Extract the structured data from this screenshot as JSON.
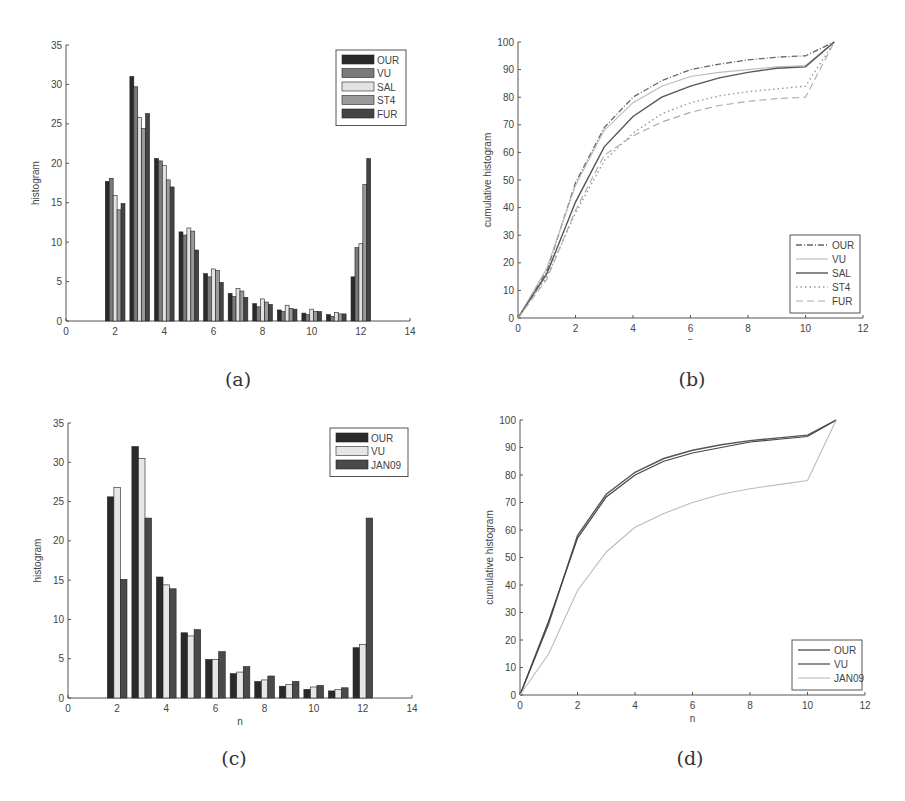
{
  "figure": {
    "captions": [
      "(a)",
      "(b)",
      "(c)",
      "(d)"
    ]
  },
  "colors": {
    "OUR": "#2a2a2a",
    "VU": "#7a7a7a",
    "SAL": "#e2e2e2",
    "ST4": "#9a9a9a",
    "FUR": "#444444",
    "JAN09": "#4a4a4a",
    "VU_c": "#e6e6e6",
    "axis": "#555555"
  },
  "chart_data": [
    {
      "id": "a",
      "type": "bar",
      "title": "",
      "xlabel": "n",
      "ylabel": "histogram",
      "xlim": [
        0,
        14
      ],
      "ylim": [
        0,
        35
      ],
      "xticks": [
        0,
        2,
        4,
        6,
        8,
        10,
        12,
        14
      ],
      "yticks": [
        0,
        5,
        10,
        15,
        20,
        25,
        30,
        35
      ],
      "legend_position": "upper right",
      "grid": false,
      "categories": [
        2,
        3,
        4,
        5,
        6,
        7,
        8,
        9,
        10,
        11,
        12
      ],
      "series": [
        {
          "name": "OUR",
          "values": [
            17.7,
            31.0,
            20.6,
            11.3,
            6.0,
            3.5,
            2.2,
            1.4,
            1.0,
            0.8,
            5.6
          ]
        },
        {
          "name": "VU",
          "values": [
            18.1,
            29.7,
            20.3,
            10.9,
            5.6,
            3.1,
            1.8,
            1.2,
            0.8,
            0.6,
            9.3
          ]
        },
        {
          "name": "SAL",
          "values": [
            15.9,
            25.8,
            19.7,
            11.8,
            6.6,
            4.1,
            2.8,
            2.0,
            1.5,
            1.1,
            9.8
          ]
        },
        {
          "name": "ST4",
          "values": [
            14.1,
            24.4,
            17.9,
            11.4,
            6.4,
            3.8,
            2.4,
            1.6,
            1.2,
            0.9,
            17.3
          ]
        },
        {
          "name": "FUR",
          "values": [
            14.9,
            26.3,
            17.0,
            9.0,
            4.9,
            3.0,
            2.1,
            1.5,
            1.2,
            0.9,
            20.6
          ]
        }
      ]
    },
    {
      "id": "b",
      "type": "line",
      "title": "",
      "xlabel": "n",
      "ylabel": "cumulative histogram",
      "xlim": [
        0,
        12
      ],
      "ylim": [
        0,
        100
      ],
      "xticks": [
        0,
        2,
        4,
        6,
        8,
        10,
        12
      ],
      "yticks": [
        0,
        10,
        20,
        30,
        40,
        50,
        60,
        70,
        80,
        90,
        100
      ],
      "legend_position": "lower right",
      "grid": false,
      "x": [
        0,
        1,
        2,
        3,
        4,
        5,
        6,
        7,
        8,
        9,
        10,
        11
      ],
      "series": [
        {
          "name": "OUR",
          "style": "dashdot",
          "values": [
            0,
            17,
            49,
            69,
            80,
            86,
            90,
            92,
            93.5,
            94.5,
            95,
            100
          ]
        },
        {
          "name": "VU",
          "style": "solid-light",
          "values": [
            0,
            18,
            48,
            68,
            78,
            84,
            87.5,
            89,
            90,
            91,
            91.5,
            100
          ]
        },
        {
          "name": "SAL",
          "style": "solid",
          "values": [
            0,
            16,
            42,
            62,
            73,
            80,
            84,
            87,
            89,
            90.5,
            91,
            100
          ]
        },
        {
          "name": "ST4",
          "style": "dotted",
          "values": [
            0,
            15,
            38,
            57,
            67,
            74,
            78,
            80.5,
            82,
            83,
            84,
            100
          ]
        },
        {
          "name": "FUR",
          "style": "dashed",
          "values": [
            0,
            14,
            39,
            59,
            66,
            71,
            74.5,
            77,
            78.5,
            79.5,
            80,
            100
          ]
        }
      ]
    },
    {
      "id": "c",
      "type": "bar",
      "title": "",
      "xlabel": "n",
      "ylabel": "histogram",
      "xlim": [
        0,
        14
      ],
      "ylim": [
        0,
        35
      ],
      "xticks": [
        0,
        2,
        4,
        6,
        8,
        10,
        12,
        14
      ],
      "yticks": [
        0,
        5,
        10,
        15,
        20,
        25,
        30,
        35
      ],
      "legend_position": "upper right",
      "grid": false,
      "categories": [
        2,
        3,
        4,
        5,
        6,
        7,
        8,
        9,
        10,
        11,
        12
      ],
      "series": [
        {
          "name": "OUR",
          "values": [
            25.6,
            32.0,
            15.4,
            8.3,
            4.9,
            3.1,
            2.1,
            1.5,
            1.1,
            0.9,
            6.4
          ]
        },
        {
          "name": "VU",
          "values": [
            26.8,
            30.5,
            14.4,
            7.9,
            4.9,
            3.3,
            2.3,
            1.7,
            1.4,
            1.1,
            6.8
          ]
        },
        {
          "name": "JAN09",
          "values": [
            15.1,
            22.9,
            13.9,
            8.7,
            5.9,
            4.0,
            2.8,
            2.1,
            1.6,
            1.3,
            22.9
          ]
        }
      ]
    },
    {
      "id": "d",
      "type": "line",
      "title": "",
      "xlabel": "n",
      "ylabel": "cumulative histogram",
      "xlim": [
        0,
        12
      ],
      "ylim": [
        0,
        100
      ],
      "xticks": [
        0,
        2,
        4,
        6,
        8,
        10,
        12
      ],
      "yticks": [
        0,
        10,
        20,
        30,
        40,
        50,
        60,
        70,
        80,
        90,
        100
      ],
      "legend_position": "lower right",
      "grid": false,
      "x": [
        0,
        1,
        2,
        3,
        4,
        5,
        6,
        7,
        8,
        9,
        10,
        11
      ],
      "series": [
        {
          "name": "OUR",
          "style": "solid",
          "values": [
            0,
            26,
            58,
            73,
            81,
            86,
            89,
            91,
            92.5,
            93.5,
            94.5,
            100
          ]
        },
        {
          "name": "VU",
          "style": "solid-dark",
          "values": [
            0,
            27,
            57,
            72,
            80,
            85,
            88,
            90,
            92,
            93,
            94,
            100
          ]
        },
        {
          "name": "JAN09",
          "style": "solid-light",
          "values": [
            0,
            15,
            38,
            52,
            61,
            66,
            70,
            73,
            75,
            76.5,
            78,
            100
          ]
        }
      ]
    }
  ]
}
